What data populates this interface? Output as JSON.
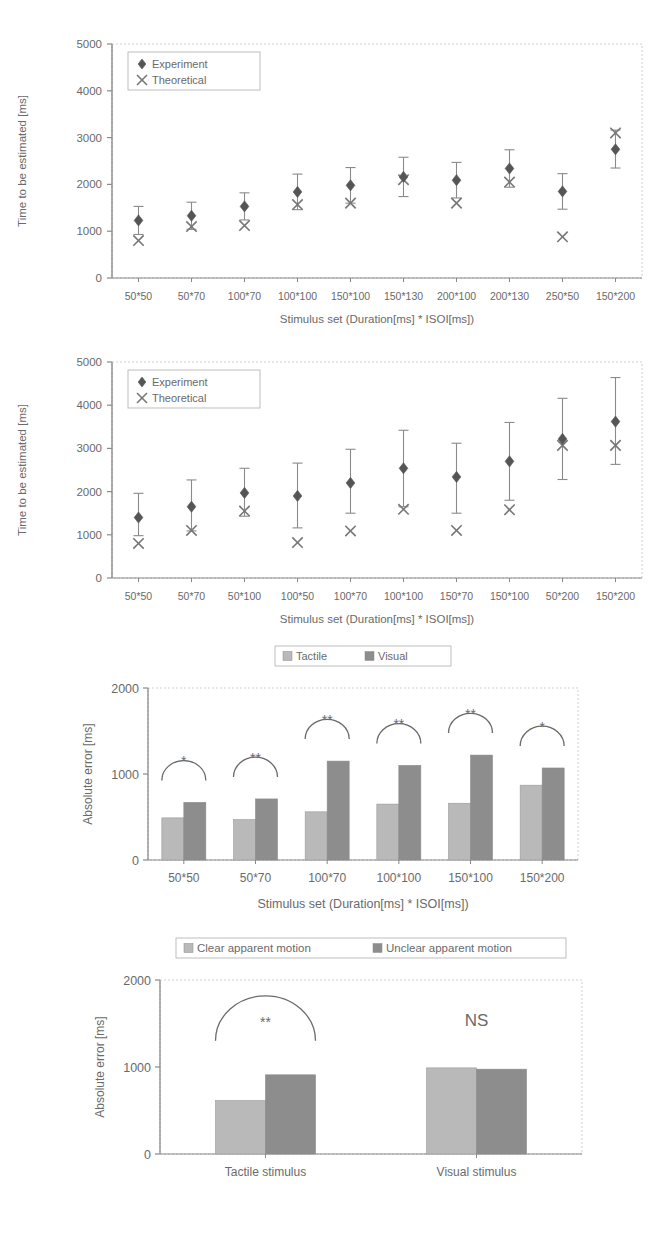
{
  "figure": {
    "panels": [
      "panel-1-tactile-scatter",
      "panel-2-visual-scatter",
      "panel-3-absolute-error-bars",
      "panel-4-apparent-motion-bars"
    ]
  },
  "colors": {
    "marker_dark": "#555555",
    "bar_light": "#b9b9b9",
    "bar_dark": "#8d8d8d",
    "axis": "#9a9a9a",
    "text": "#6a6a6a"
  },
  "chart_data": [
    {
      "id": "panel-1",
      "type": "scatter",
      "title": "",
      "xlabel": "Stimulus set (Duration[ms] * ISOI[ms])",
      "ylabel": "Time to be estimated [ms]",
      "ylim": [
        0,
        5000
      ],
      "yticks": [
        0,
        1000,
        2000,
        3000,
        4000,
        5000
      ],
      "ytick_labels": [
        "0",
        "1000",
        "2000",
        "3000",
        "4000",
        "5000"
      ],
      "grid": false,
      "legend": [
        {
          "label": "Experiment",
          "marker": "diamond"
        },
        {
          "label": "Theoretical",
          "marker": "cross"
        }
      ],
      "legend_position": "top-left",
      "categories": [
        "50*50",
        "50*70",
        "100*70",
        "100*100",
        "150*100",
        "150*130",
        "200*100",
        "200*130",
        "250*50",
        "150*200"
      ],
      "series": [
        {
          "name": "Experiment",
          "marker": "diamond",
          "values": [
            1230,
            1330,
            1530,
            1840,
            1980,
            2160,
            2090,
            2340,
            1850,
            2750
          ],
          "err_low": [
            300,
            290,
            290,
            380,
            380,
            420,
            380,
            400,
            380,
            400
          ],
          "err_high": [
            300,
            290,
            290,
            380,
            380,
            420,
            380,
            400,
            380,
            410
          ]
        },
        {
          "name": "Theoretical",
          "marker": "cross",
          "values": [
            800,
            1100,
            1120,
            1570,
            1600,
            2100,
            1600,
            2050,
            880,
            3100
          ]
        }
      ]
    },
    {
      "id": "panel-2",
      "type": "scatter",
      "title": "",
      "xlabel": "Stimulus set (Duration[ms] * ISOI[ms])",
      "ylabel": "Time to be estimated [ms]",
      "ylim": [
        0,
        5000
      ],
      "yticks": [
        0,
        1000,
        2000,
        3000,
        4000,
        5000
      ],
      "ytick_labels": [
        "0",
        "1000",
        "2000",
        "3000",
        "4000",
        "5000"
      ],
      "grid": false,
      "legend": [
        {
          "label": "Experiment",
          "marker": "diamond"
        },
        {
          "label": "Theoretical",
          "marker": "cross"
        }
      ],
      "legend_position": "top-left",
      "categories": [
        "50*50",
        "50*70",
        "50*100",
        "100*50",
        "100*70",
        "100*100",
        "150*70",
        "150*100",
        "50*200",
        "150*200"
      ],
      "series": [
        {
          "name": "Experiment",
          "marker": "diamond",
          "values": [
            1400,
            1650,
            1970,
            1900,
            2200,
            2540,
            2340,
            2700,
            3220,
            3620
          ],
          "err_low": [
            420,
            560,
            540,
            740,
            700,
            890,
            840,
            900,
            940,
            990
          ],
          "err_high": [
            560,
            620,
            570,
            760,
            780,
            880,
            780,
            900,
            940,
            1020
          ]
        },
        {
          "name": "Theoretical",
          "marker": "cross",
          "values": [
            800,
            1100,
            1550,
            820,
            1090,
            1590,
            1100,
            1580,
            3070,
            3070
          ]
        }
      ]
    },
    {
      "id": "panel-3",
      "type": "bar",
      "title": "",
      "xlabel": "Stimulus set (Duration[ms] * ISOI[ms])",
      "ylabel": "Absolute error [ms]",
      "ylim": [
        0,
        2000
      ],
      "yticks": [
        0,
        1000,
        2000
      ],
      "ytick_labels": [
        "0",
        "1000",
        "2000"
      ],
      "grid": false,
      "legend": [
        {
          "label": "Tactile",
          "color": "#b9b9b9"
        },
        {
          "label": "Visual",
          "color": "#8d8d8d"
        }
      ],
      "legend_position": "top-center",
      "categories": [
        "50*50",
        "50*70",
        "100*70",
        "100*100",
        "150*100",
        "150*200"
      ],
      "series": [
        {
          "name": "Tactile",
          "color": "#b9b9b9",
          "values": [
            490,
            470,
            560,
            650,
            660,
            870
          ]
        },
        {
          "name": "Visual",
          "color": "#8d8d8d",
          "values": [
            670,
            710,
            1150,
            1100,
            1220,
            1070
          ]
        }
      ],
      "annotations": [
        {
          "category": "50*50",
          "text": "*"
        },
        {
          "category": "50*70",
          "text": "**"
        },
        {
          "category": "100*70",
          "text": "**"
        },
        {
          "category": "100*100",
          "text": "**"
        },
        {
          "category": "150*100",
          "text": "**"
        },
        {
          "category": "150*200",
          "text": "*"
        }
      ]
    },
    {
      "id": "panel-4",
      "type": "bar",
      "title": "",
      "xlabel": "",
      "ylabel": "Absolute error [ms]",
      "ylim": [
        0,
        2000
      ],
      "yticks": [
        0,
        1000,
        2000
      ],
      "ytick_labels": [
        "0",
        "1000",
        "2000"
      ],
      "grid": false,
      "legend": [
        {
          "label": "Clear apparent motion",
          "color": "#b9b9b9"
        },
        {
          "label": "Unclear apparent motion",
          "color": "#8d8d8d"
        }
      ],
      "legend_position": "top-center",
      "categories": [
        "Tactile stimulus",
        "Visual stimulus"
      ],
      "series": [
        {
          "name": "Clear apparent motion",
          "color": "#b9b9b9",
          "values": [
            615,
            990
          ]
        },
        {
          "name": "Unclear apparent motion",
          "color": "#8d8d8d",
          "values": [
            910,
            975
          ]
        }
      ],
      "annotations": [
        {
          "category": "Tactile stimulus",
          "text": "**"
        },
        {
          "category": "Visual stimulus",
          "text": "NS"
        }
      ]
    }
  ]
}
